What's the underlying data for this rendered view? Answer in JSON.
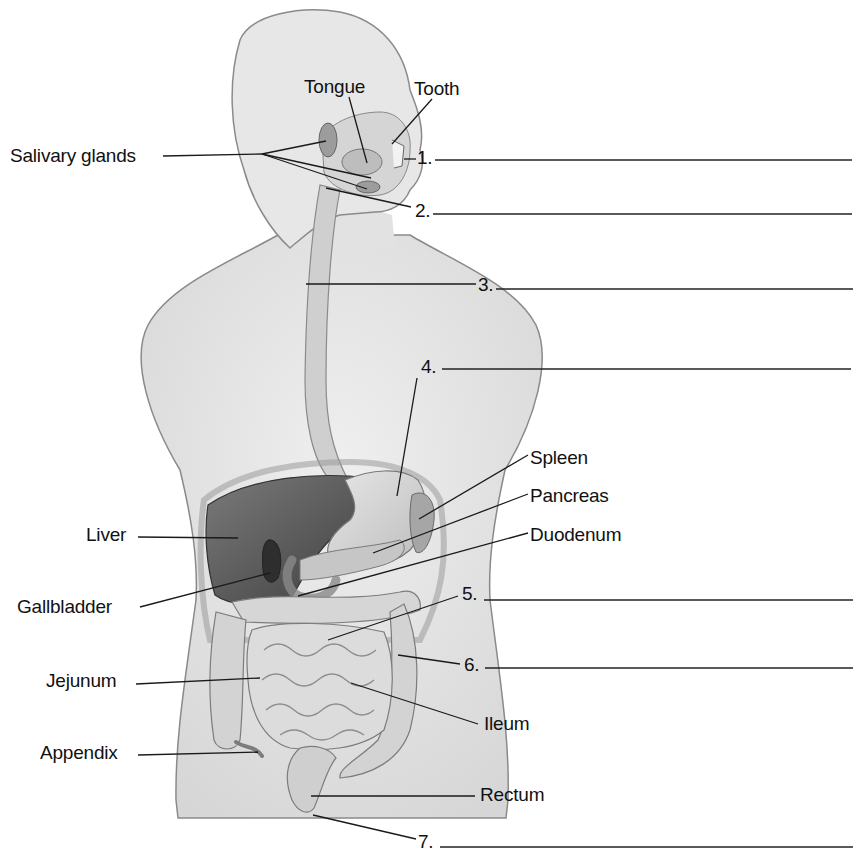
{
  "diagram": {
    "colors": {
      "background": "#ffffff",
      "body_fill": "#e4e4e4",
      "body_stroke": "#8a8a8a",
      "organ_light": "#d2d2d2",
      "organ_mid": "#b4b4b4",
      "liver": "#5e5e5e",
      "ink": "#111111"
    },
    "labels": [
      {
        "id": "tongue",
        "text": "Tongue",
        "x": 304,
        "y": 77
      },
      {
        "id": "tooth",
        "text": "Tooth",
        "x": 414,
        "y": 79
      },
      {
        "id": "salivary-glands",
        "text": "Salivary glands",
        "x": 10,
        "y": 146
      },
      {
        "id": "spleen",
        "text": "Spleen",
        "x": 530,
        "y": 448
      },
      {
        "id": "pancreas",
        "text": "Pancreas",
        "x": 530,
        "y": 486
      },
      {
        "id": "duodenum",
        "text": "Duodenum",
        "x": 530,
        "y": 525
      },
      {
        "id": "liver",
        "text": "Liver",
        "x": 86,
        "y": 525
      },
      {
        "id": "gallbladder",
        "text": "Gallbladder",
        "x": 17,
        "y": 597
      },
      {
        "id": "jejunum",
        "text": "Jejunum",
        "x": 46,
        "y": 671
      },
      {
        "id": "ileum",
        "text": "Ileum",
        "x": 484,
        "y": 714
      },
      {
        "id": "appendix",
        "text": "Appendix",
        "x": 40,
        "y": 743
      },
      {
        "id": "rectum",
        "text": "Rectum",
        "x": 480,
        "y": 785
      }
    ],
    "blanks": [
      {
        "number": "1.",
        "x": 417,
        "y": 148,
        "line_from": 435,
        "line_to": 852,
        "line_y": 160
      },
      {
        "number": "2.",
        "x": 415,
        "y": 201,
        "line_from": 433,
        "line_to": 852,
        "line_y": 214
      },
      {
        "number": "3.",
        "x": 478,
        "y": 275,
        "line_from": 496,
        "line_to": 853,
        "line_y": 289
      },
      {
        "number": "4.",
        "x": 421,
        "y": 357,
        "line_from": 442,
        "line_to": 851,
        "line_y": 369
      },
      {
        "number": "5.",
        "x": 462,
        "y": 584,
        "line_from": 484,
        "line_to": 853,
        "line_y": 600
      },
      {
        "number": "6.",
        "x": 464,
        "y": 655,
        "line_from": 485,
        "line_to": 853,
        "line_y": 668
      },
      {
        "number": "7.",
        "x": 418,
        "y": 832,
        "line_from": 440,
        "line_to": 853,
        "line_y": 847
      }
    ],
    "leaders": [
      {
        "for": "tongue",
        "x1": 349,
        "y1": 97,
        "x2": 367,
        "y2": 163
      },
      {
        "for": "tooth",
        "x1": 432,
        "y1": 99,
        "x2": 392,
        "y2": 144
      },
      {
        "for": "salivary-glands",
        "x1": 163,
        "y1": 156,
        "x2": 262,
        "y2": 154
      },
      {
        "for": "salivary-glands",
        "x1": 262,
        "y1": 154,
        "x2": 326,
        "y2": 141
      },
      {
        "for": "salivary-glands",
        "x1": 262,
        "y1": 154,
        "x2": 371,
        "y2": 178
      },
      {
        "for": "salivary-glands",
        "x1": 262,
        "y1": 154,
        "x2": 367,
        "y2": 189
      },
      {
        "for": "1",
        "x1": 404,
        "y1": 159,
        "x2": 416,
        "y2": 159
      },
      {
        "for": "2",
        "x1": 326,
        "y1": 188,
        "x2": 411,
        "y2": 207
      },
      {
        "for": "3",
        "x1": 306,
        "y1": 284,
        "x2": 476,
        "y2": 284
      },
      {
        "for": "4",
        "x1": 417,
        "y1": 378,
        "x2": 397,
        "y2": 496
      },
      {
        "for": "spleen",
        "x1": 528,
        "y1": 455,
        "x2": 419,
        "y2": 519
      },
      {
        "for": "pancreas",
        "x1": 528,
        "y1": 494,
        "x2": 373,
        "y2": 553
      },
      {
        "for": "duodenum",
        "x1": 528,
        "y1": 533,
        "x2": 298,
        "y2": 596
      },
      {
        "for": "liver",
        "x1": 138,
        "y1": 537,
        "x2": 238,
        "y2": 538
      },
      {
        "for": "gallbladder",
        "x1": 140,
        "y1": 607,
        "x2": 270,
        "y2": 573
      },
      {
        "for": "5",
        "x1": 458,
        "y1": 596,
        "x2": 328,
        "y2": 640
      },
      {
        "for": "6",
        "x1": 460,
        "y1": 664,
        "x2": 398,
        "y2": 655
      },
      {
        "for": "jejunum",
        "x1": 136,
        "y1": 684,
        "x2": 260,
        "y2": 678
      },
      {
        "for": "ileum",
        "x1": 478,
        "y1": 724,
        "x2": 351,
        "y2": 683
      },
      {
        "for": "appendix",
        "x1": 138,
        "y1": 755,
        "x2": 258,
        "y2": 752
      },
      {
        "for": "rectum",
        "x1": 475,
        "y1": 796,
        "x2": 311,
        "y2": 796
      },
      {
        "for": "7",
        "x1": 416,
        "y1": 839,
        "x2": 313,
        "y2": 815
      }
    ]
  }
}
